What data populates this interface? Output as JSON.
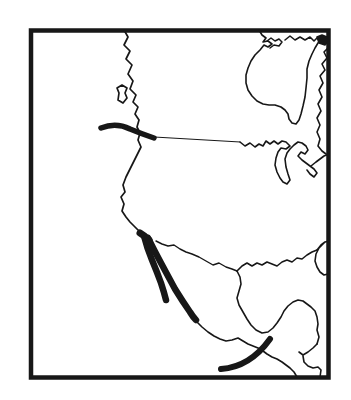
{
  "figure": {
    "type": "map",
    "canvas": {
      "width": 351,
      "height": 400,
      "background_color": "#ffffff"
    },
    "ink_color": "#171717",
    "frame": {
      "x": 31,
      "y": 30.5,
      "width": 297.5,
      "height": 347,
      "stroke_width": 4.5
    },
    "features": [
      {
        "name": "pacific-coastline",
        "kind": "coastline",
        "stroke_width": 1.7,
        "fill": "none",
        "path": "M124,30 L128,37 L124,45 L130,51 L126,59 L132,65 L128,74 L133,81 L130,89 L136,95 L133,102 L138,107 L135,114 L139,120 L137,127 L140,133 L138,140 L141,147 L138,153 L134,161 L130,169 L126,177 L123,185 L125,192 L121,197 L124,204 L122,211 L126,217 L130,222 L134,226 L139,231 L143,235"
      },
      {
        "name": "vancouver-island",
        "kind": "island",
        "stroke_width": 1.7,
        "fill": "none",
        "path": "M117,88 L122,85 L127,88 L125,93 L127,98 L123,103 L118,100 L119,93 Z"
      },
      {
        "name": "juan-de-fuca-ridge-segment",
        "kind": "ridge-segment",
        "stroke_width": 5.5,
        "fill": "none",
        "path": "M101,128 Q116,122 130,129 Q142,134 154,138"
      },
      {
        "name": "ridge-to-great-lakes-line",
        "kind": "connector-line",
        "stroke_width": 1.0,
        "fill": "none",
        "path": "M154,137 L240,142"
      },
      {
        "name": "great-lakes-outline",
        "kind": "lake",
        "stroke_width": 1.6,
        "fill": "none",
        "path": "M240,142 L245,146 L250,143 L255,147 L259,144 L263,146 L266,141 L270,144 L274,141 L278,144 L282,141 L286,142 L290,146 L286,149 L281,148 L278,152 L276,158 L275,165 L277,172 L280,178 L283,182 L287,184 L290,180 L288,174 L286,167 L285,159 L287,153 L290,149 L294,145 L298,142 L302,143 L306,146 L308,150 L305,154 L301,152 L298,156 L302,160 L306,163 L310,166 L314,169 L317,173 L314,177 L310,174 L307,170 M311,166 L316,162 L320,159 L324,156 L329,154"
      },
      {
        "name": "hudson-bay-outline",
        "kind": "coastline",
        "stroke_width": 1.6,
        "fill": "none",
        "path": "M259,30 L262,35 L266,38 L263,42 L268,41 L272,44 L268,47 L264,45 L260,50 L255,55 L251,61 L248,68 L246,75 L246,83 L248,90 L252,96 L257,101 L263,104 L269,105 L275,105 L281,107 L285,110 L288,114 L289,119 L292,123 L296,124 L299,120 L301,114 L303,106 L305,97 L306,88 L307,78 L307,69 L309,61 L312,54 L315,48 L318,43 L321,39"
      },
      {
        "name": "foxe-basin-coast",
        "kind": "coastline",
        "stroke_width": 1.5,
        "fill": "none",
        "path": "M267,41 L271,38 L275,41 L279,39 L282,42 L279,46 L274,45 L270,48"
      },
      {
        "name": "arctic-coast",
        "kind": "coastline",
        "stroke_width": 1.6,
        "fill": "none",
        "path": "M285,40 L290,36 L295,40 L300,37 L305,40 L310,37 L314,41 L318,37"
      },
      {
        "name": "corner-ink-patch",
        "kind": "filled-patch",
        "stroke_width": 1.5,
        "fill": "ink",
        "path": "M317,37 L322,35 L327,37 L329,41 L325,45 L319,43 Z"
      },
      {
        "name": "labrador-atlantic-coast",
        "kind": "coastline",
        "stroke_width": 1.6,
        "fill": "none",
        "path": "M329,47 L324,52 L327,58 L322,64 L325,70 L320,76 L323,83 L319,90 L322,97 L318,104 L321,111 L317,118 L320,125 L317,132 L320,139 L318,146 L322,151 L326,154"
      },
      {
        "name": "rio-grande-border-line",
        "kind": "coastline",
        "stroke_width": 1.4,
        "fill": "none",
        "path": "M156,241 L162,244 L168,246 L174,245 L180,249 L186,252 L192,254 L199,257 L206,261 L213,265 L219,263 L226,267 L232,269 L237,271"
      },
      {
        "name": "gulf-of-mexico-north-coast",
        "kind": "coastline",
        "stroke_width": 1.6,
        "fill": "none",
        "path": "M237,271 L242,266 L247,263 L252,266 L257,263 L262,265 L267,262 L272,264 L277,266 L282,262 L287,260 L292,262 L297,258 L302,259 L307,255 L312,252 L317,250"
      },
      {
        "name": "florida-peninsula",
        "kind": "coastline",
        "stroke_width": 1.6,
        "fill": "none",
        "path": "M317,250 L321,245 L325,242 L329,241 M324,243 L319,248 L316,254 L315,261 L317,267 L320,272 L324,275 L328,274 L329,271"
      },
      {
        "name": "west-gulf-and-yucatan-coast",
        "kind": "coastline",
        "stroke_width": 1.6,
        "fill": "none",
        "path": "M237,271 L240,277 L241,284 L239,291 L237,298 L239,305 L243,312 L247,319 L251,325 L256,330 L262,333 L268,332 L273,328 L277,323 L281,317 L284,311 L288,306 L293,302 L298,300 L303,301 L307,304 L311,307 L315,311 L317,317 L318,324 L317,330 L319,337 L317,344"
      },
      {
        "name": "caribbean-honduras-coast",
        "kind": "coastline",
        "stroke_width": 1.6,
        "fill": "none",
        "path": "M317,344 L313,348 L308,352 L303,355 L299,352 M303,356 L304,362 L308,366 L313,368 L318,367 L321,370 L320,377"
      },
      {
        "name": "gulf-of-california-head-junction",
        "kind": "ridge-segment",
        "stroke_width": 7,
        "fill": "none",
        "path": "M140,233 Q145,236 149,240"
      },
      {
        "name": "baja-california-ridge-west",
        "kind": "ridge-segment",
        "stroke_width": 6.5,
        "fill": "none",
        "path": "M144,236 Q147,248 152,260 Q157,272 161,283 Q164,292 166,300"
      },
      {
        "name": "gulf-of-california-ridge-east",
        "kind": "ridge-segment",
        "stroke_width": 6.5,
        "fill": "none",
        "path": "M148,238 Q154,250 161,263 Q168,276 175,289 Q183,302 190,312 Q193,317 196,320"
      },
      {
        "name": "mexico-pacific-coast",
        "kind": "coastline",
        "stroke_width": 1.6,
        "fill": "none",
        "path": "M196,321 L202,327 L208,332 L214,336 L220,339 L226,341 L232,340 L238,338 L243,341 L248,344 L253,346 L258,348 L263,351 L267,354 L272,357 L277,359 L282,362 L286,365 L290,368 L294,372 L297,377"
      },
      {
        "name": "middle-america-trench-arc",
        "kind": "ridge-segment",
        "stroke_width": 6,
        "fill": "none",
        "path": "M221,369 Q250,367 270,339"
      }
    ]
  }
}
